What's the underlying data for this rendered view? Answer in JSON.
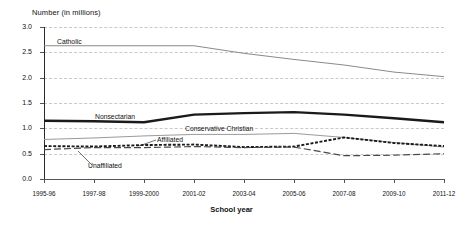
{
  "chart_data": {
    "type": "line",
    "title": "",
    "ylabel": "Number (in millions)",
    "xlabel": "School year",
    "ylim": [
      0.0,
      3.0
    ],
    "yticks": [
      "0.0",
      "0.5",
      "1.0",
      "1.5",
      "2.0",
      "2.5",
      "3.0"
    ],
    "ytick_values": [
      0.0,
      0.5,
      1.0,
      1.5,
      2.0,
      2.5,
      3.0
    ],
    "grid": "horizontal-dashed",
    "legend": "inline-labels",
    "categories": [
      "1995-96",
      "1997-98",
      "1999-2000",
      "2001-02",
      "2003-04",
      "2005-06",
      "2007-08",
      "2009-10",
      "2011-12"
    ],
    "series": [
      {
        "name": "Catholic",
        "style": "solid-thin",
        "values": [
          2.63,
          2.63,
          2.63,
          2.63,
          2.48,
          2.36,
          2.25,
          2.11,
          2.02
        ]
      },
      {
        "name": "Nonsectarian",
        "style": "solid-thick",
        "values": [
          1.15,
          1.14,
          1.12,
          1.27,
          1.3,
          1.32,
          1.27,
          1.2,
          1.12
        ]
      },
      {
        "name": "Conservative Christian",
        "style": "solid-thin",
        "values": [
          0.78,
          0.81,
          0.85,
          0.88,
          0.88,
          0.9,
          0.82,
          0.72,
          0.63
        ]
      },
      {
        "name": "Affiliated",
        "style": "dotted-thick",
        "values": [
          0.65,
          0.64,
          0.67,
          0.68,
          0.63,
          0.64,
          0.82,
          0.71,
          0.65
        ]
      },
      {
        "name": "Unaffiliated",
        "style": "dashed-long",
        "values": [
          0.58,
          0.62,
          0.62,
          0.64,
          0.62,
          0.63,
          0.46,
          0.47,
          0.5
        ]
      }
    ]
  },
  "labels": {
    "catholic": "Catholic",
    "nonsectarian": "Nonsectarian",
    "conservative_christian": "Conservative Christian",
    "affiliated": "Affiliated",
    "unaffiliated": "Unaffiliated"
  },
  "axes": {
    "y_title": "Number (in millions)",
    "x_title": "School year"
  },
  "colors": {
    "catholic": "#8a8a8a",
    "nonsectarian": "#1a1a1a",
    "conservative_christian": "#9a9a9a",
    "affiliated": "#1a1a1a",
    "unaffiliated": "#4a4a4a",
    "grid": "#c9c9c9",
    "axis": "#2a2a2a",
    "background": "#ffffff"
  }
}
